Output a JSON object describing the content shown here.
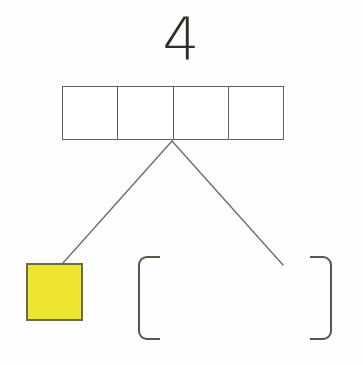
{
  "worksheet": {
    "type": "number-bond-tape-diagram",
    "background_color": "#fdfdfd",
    "width": 363,
    "height": 365
  },
  "total": {
    "value": "4",
    "name": "total-number",
    "color": "#2e2e28"
  },
  "bar_model": {
    "cell_count": 4,
    "border_color": "#5f6352",
    "fill_color": "#ffffff",
    "cells": [
      {
        "label": "",
        "shaded": false
      },
      {
        "label": "",
        "shaded": false
      },
      {
        "label": "",
        "shaded": false
      },
      {
        "label": "",
        "shaded": false
      }
    ]
  },
  "connectors": {
    "stroke_color": "#6e7162",
    "stroke_width": 1.4,
    "lines": [
      {
        "name": "connector-line-left",
        "x1": 172,
        "y1": 141,
        "x2": 63,
        "y2": 263
      },
      {
        "name": "connector-line-right",
        "x1": 172,
        "y1": 141,
        "x2": 283,
        "y2": 265
      }
    ]
  },
  "parts": [
    {
      "name": "part-square-filled",
      "shape": "square",
      "fill_color": "#eee62e",
      "border_color": "#6b6b40",
      "label": ""
    },
    {
      "name": "part-bracket-empty",
      "shape": "bracket-pair",
      "border_color": "#55594a",
      "left_glyph": "[",
      "right_glyph": "]",
      "label": ""
    }
  ]
}
